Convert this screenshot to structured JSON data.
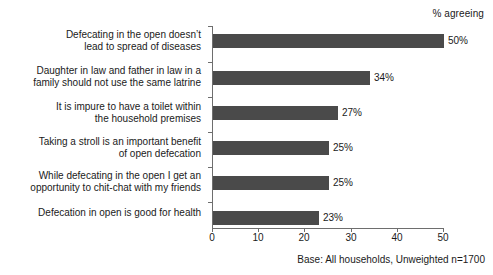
{
  "header": {
    "percent_note": "% agreeing"
  },
  "footnote": {
    "text": "Base: All households, Unweighted n=1700"
  },
  "colors": {
    "bar": "#4a4a4a",
    "axis": "#6e6e6e",
    "text": "#1a1a1a",
    "background": "#ffffff"
  },
  "chart_data": {
    "type": "bar",
    "orientation": "horizontal",
    "title": "",
    "subtitle": "",
    "xlabel": "",
    "ylabel": "",
    "xlim": [
      0,
      50
    ],
    "grid": false,
    "legend": null,
    "annotations": [
      "% agreeing",
      "Base: All households, Unweighted n=1700"
    ],
    "xticks": [
      0,
      10,
      20,
      30,
      40,
      50
    ],
    "xtick_labels": [
      "0",
      "10",
      "20",
      "30",
      "40",
      "50"
    ],
    "categories": [
      "Defecating in the open doesn’t\nlead to spread of diseases",
      "Daughter in law and father in law in a\nfamily should not use the same latrine",
      "It is impure to have a toilet within\nthe household premises",
      "Taking a stroll is an important benefit\nof open defecation",
      "While defecating in the open I get an\nopportunity to chit-chat with my friends",
      "Defecation in open is good for health"
    ],
    "values": [
      50,
      34,
      27,
      25,
      25,
      23
    ],
    "value_labels": [
      "50%",
      "34%",
      "27%",
      "25%",
      "25%",
      "23%"
    ]
  }
}
